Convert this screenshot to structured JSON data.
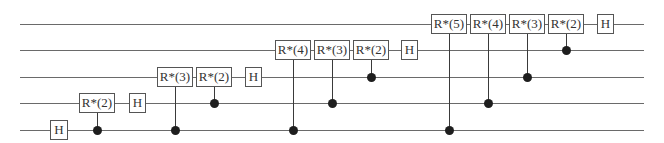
{
  "diagram": {
    "type": "quantum-circuit",
    "wire_count": 5,
    "wire_x_start": 20,
    "wire_x_end": 644,
    "wire_y": [
      24,
      50,
      77,
      103,
      130
    ],
    "colors": {
      "wire": "#6a6a6a",
      "gate_border": "#555555",
      "control_dot": "#1e1e1e",
      "text": "#333333"
    },
    "gates": [
      {
        "label": "H",
        "wire": 4,
        "x": 50,
        "w": 18
      },
      {
        "label": "R*(2)",
        "wire": 3,
        "x": 79,
        "w": 36,
        "control_wire": 4
      },
      {
        "label": "H",
        "wire": 3,
        "x": 129,
        "w": 17
      },
      {
        "label": "R*(3)",
        "wire": 2,
        "x": 157,
        "w": 36,
        "control_wire": 4
      },
      {
        "label": "R*(2)",
        "wire": 2,
        "x": 196,
        "w": 36,
        "control_wire": 3
      },
      {
        "label": "H",
        "wire": 2,
        "x": 245,
        "w": 17
      },
      {
        "label": "R*(4)",
        "wire": 1,
        "x": 275,
        "w": 36,
        "control_wire": 4
      },
      {
        "label": "R*(3)",
        "wire": 1,
        "x": 314,
        "w": 36,
        "control_wire": 3
      },
      {
        "label": "R*(2)",
        "wire": 1,
        "x": 353,
        "w": 36,
        "control_wire": 2
      },
      {
        "label": "H",
        "wire": 1,
        "x": 401,
        "w": 17
      },
      {
        "label": "R*(5)",
        "wire": 0,
        "x": 431,
        "w": 36,
        "control_wire": 4
      },
      {
        "label": "R*(4)",
        "wire": 0,
        "x": 470,
        "w": 36,
        "control_wire": 3
      },
      {
        "label": "R*(3)",
        "wire": 0,
        "x": 509,
        "w": 36,
        "control_wire": 2
      },
      {
        "label": "R*(2)",
        "wire": 0,
        "x": 548,
        "w": 36,
        "control_wire": 1
      },
      {
        "label": "H",
        "wire": 0,
        "x": 597,
        "w": 17
      }
    ]
  }
}
